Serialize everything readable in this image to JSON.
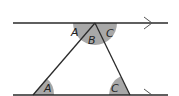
{
  "diagram": {
    "type": "parallel-lines-triangle-angles",
    "labels": {
      "top_left": "A",
      "top_middle": "B",
      "top_right": "C",
      "bottom_left": "A",
      "bottom_right": "C"
    },
    "colors": {
      "line": "#2a2a2a",
      "angle_fill": "#a8a8a8",
      "background": "#ffffff"
    }
  }
}
